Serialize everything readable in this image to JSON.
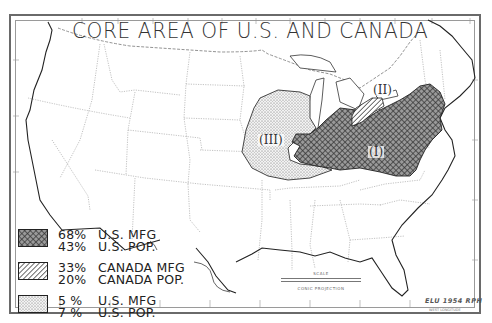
{
  "map": {
    "title": "CORE AREA OF U.S. AND CANADA",
    "projection": "CONIC PROJECTION",
    "scale_label": "SCALE",
    "credit": "ELU 1954 RPH",
    "credit_sub": "WEST LONGITUDE"
  },
  "regions": [
    {
      "id": "I",
      "label": "(I)",
      "pattern": "crosshatch",
      "color": "#555555"
    },
    {
      "id": "II",
      "label": "(II)",
      "pattern": "diagonal-hatch",
      "color": "#333333"
    },
    {
      "id": "III",
      "label": "(III)",
      "pattern": "stipple",
      "color": "#888888"
    }
  ],
  "legend": [
    {
      "region": "I",
      "pattern": "crosshatch",
      "line1_pct": "68%",
      "line1_label": "U.S. MFG",
      "line2_pct": "43%",
      "line2_label": "U.S. POP."
    },
    {
      "region": "II",
      "pattern": "diagonal-hatch",
      "line1_pct": "33%",
      "line1_label": "CANADA MFG",
      "line2_pct": "20%",
      "line2_label": "CANADA POP."
    },
    {
      "region": "III",
      "pattern": "stipple",
      "line1_pct": "5 %",
      "line1_label": "U.S. MFG",
      "line2_pct": "7 %",
      "line2_label": "U.S. POP."
    }
  ],
  "colors": {
    "ink": "#222222",
    "boundary": "#8a8a8a",
    "frame": "#6a6a6a",
    "paper": "#ffffff"
  }
}
